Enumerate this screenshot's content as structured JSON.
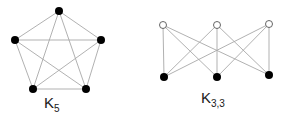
{
  "graphs": [
    {
      "name": "K5",
      "label_main": "K",
      "label_sub": "5",
      "label_pos": [
        44,
        108
      ],
      "vertex_fill": "#000000",
      "vertices": [
        {
          "x": 59,
          "y": 11,
          "filled": true
        },
        {
          "x": 101,
          "y": 40,
          "filled": true
        },
        {
          "x": 86,
          "y": 89,
          "filled": true
        },
        {
          "x": 33,
          "y": 89,
          "filled": true
        },
        {
          "x": 15,
          "y": 40,
          "filled": true
        }
      ],
      "edges": [
        [
          0,
          1
        ],
        [
          0,
          2
        ],
        [
          0,
          3
        ],
        [
          0,
          4
        ],
        [
          1,
          2
        ],
        [
          1,
          3
        ],
        [
          1,
          4
        ],
        [
          2,
          3
        ],
        [
          2,
          4
        ],
        [
          3,
          4
        ]
      ]
    },
    {
      "name": "K3,3",
      "label_main": "K",
      "label_sub": "3,3",
      "label_pos": [
        201,
        103
      ],
      "vertex_fill": "#000000",
      "vertices": [
        {
          "x": 163,
          "y": 25,
          "filled": false
        },
        {
          "x": 217,
          "y": 25,
          "filled": false
        },
        {
          "x": 269,
          "y": 24,
          "filled": false
        },
        {
          "x": 164,
          "y": 77,
          "filled": true
        },
        {
          "x": 217,
          "y": 77,
          "filled": true
        },
        {
          "x": 269,
          "y": 75,
          "filled": true
        }
      ],
      "edges": [
        [
          0,
          3
        ],
        [
          0,
          4
        ],
        [
          0,
          5
        ],
        [
          1,
          3
        ],
        [
          1,
          4
        ],
        [
          1,
          5
        ],
        [
          2,
          3
        ],
        [
          2,
          4
        ],
        [
          2,
          5
        ]
      ]
    }
  ]
}
